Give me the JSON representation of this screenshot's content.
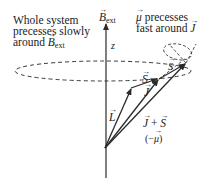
{
  "diagram": {
    "labels": {
      "left_note_line1": "Whole system",
      "left_note_line2": "precesses slowly",
      "left_note_line3": "around",
      "left_note_field": "B",
      "left_note_field_sub": "ext",
      "right_note_line1_symbol": "μ",
      "right_note_line1_text": " precesses",
      "right_note_line2_text": "fast around ",
      "right_note_line2_symbol": "J",
      "axis_field": "B",
      "axis_field_sub": "ext",
      "axis_z": "z",
      "vec_L": "L",
      "vec_S": "S",
      "vec_J": "J",
      "vec_S_small": "S",
      "sum_J": "J",
      "sum_plus": " + ",
      "sum_S": "S",
      "neg_mu_open": "(−",
      "neg_mu_symbol": "μ",
      "neg_mu_close": ")"
    },
    "colors": {
      "stroke": "#2a2a2a",
      "dashed": "#3a3a3a",
      "background": "#ffffff"
    },
    "vectors": [
      {
        "name": "L",
        "from": [
          105,
          148
        ],
        "to": [
          131,
          88
        ]
      },
      {
        "name": "S",
        "from": [
          131,
          88
        ],
        "to": [
          158,
          78
        ]
      },
      {
        "name": "J",
        "from": [
          105,
          148
        ],
        "to": [
          159,
          79
        ]
      },
      {
        "name": "J+S (-mu)",
        "from": [
          105,
          148
        ],
        "to": [
          186,
          63
        ]
      }
    ],
    "axis": {
      "name": "z / B_ext",
      "x": 106,
      "y_top": 22,
      "y_bottom": 178
    },
    "ellipse": {
      "cx": 103,
      "cy": 71,
      "rx": 88,
      "ry": 10
    }
  }
}
